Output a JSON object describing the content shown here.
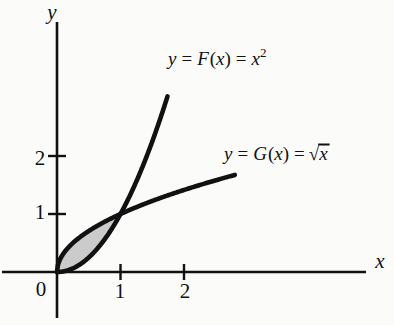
{
  "figure": {
    "name": "area-between-curves-diagram",
    "background_color": "#fbfbf9",
    "ink_color": "#111111",
    "shade_fill_color": "#c8c8c8"
  },
  "axes": {
    "x_axis_label": "x",
    "y_axis_label": "y",
    "origin_label": "0",
    "x_ticks": [
      {
        "value": 1,
        "label": "1"
      },
      {
        "value": 2,
        "label": "2"
      }
    ],
    "y_ticks": [
      {
        "value": 1,
        "label": "1"
      },
      {
        "value": 2,
        "label": "2"
      }
    ],
    "x_range": [
      -0.9,
      5.2
    ],
    "y_range": [
      -0.9,
      4.8
    ],
    "grid": false
  },
  "labels": {
    "parabola": {
      "prefix": "y",
      "eq1": "=",
      "fn": "F",
      "open": "(",
      "arg": "x",
      "close": ")",
      "eq2": "=",
      "base": "x",
      "exponent": "2"
    },
    "sqrt": {
      "prefix": "y",
      "eq1": "=",
      "fn": "G",
      "open": "(",
      "arg": "x",
      "close": ")",
      "eq2": "=",
      "radical": "√",
      "radicand": "x"
    },
    "parabola_text": "y = F(x) = x2",
    "sqrt_text": "y = G(x) = √x"
  },
  "chart_data": {
    "type": "line",
    "title": "",
    "xlabel": "x",
    "ylabel": "y",
    "xlim": [
      -0.9,
      5.2
    ],
    "ylim": [
      -0.9,
      4.8
    ],
    "grid": false,
    "legend_position": "inline-curve-labels",
    "xticks": [
      1,
      2
    ],
    "yticks": [
      1,
      2
    ],
    "series": [
      {
        "name": "y = F(x) = x^2",
        "formula": "x^2",
        "x": [
          0,
          0.1,
          0.2,
          0.3,
          0.4,
          0.5,
          0.6,
          0.7,
          0.8,
          0.9,
          1.0,
          1.1,
          1.2,
          1.3,
          1.4,
          1.5,
          1.6,
          1.7
        ],
        "y": [
          0,
          0.01,
          0.04,
          0.09,
          0.16,
          0.25,
          0.36,
          0.49,
          0.64,
          0.81,
          1.0,
          1.21,
          1.44,
          1.69,
          1.96,
          2.25,
          2.56,
          2.89
        ],
        "x_end": 1.74,
        "y_end": 3.03
      },
      {
        "name": "y = G(x) = sqrt(x)",
        "formula": "sqrt(x)",
        "x": [
          0,
          0.1,
          0.2,
          0.3,
          0.4,
          0.5,
          0.6,
          0.7,
          0.8,
          0.9,
          1.0,
          1.3,
          1.6,
          1.9,
          2.2,
          2.5,
          2.8
        ],
        "y": [
          0,
          0.316,
          0.447,
          0.548,
          0.632,
          0.707,
          0.775,
          0.837,
          0.894,
          0.949,
          1.0,
          1.14,
          1.265,
          1.378,
          1.483,
          1.581,
          1.673
        ],
        "x_end": 2.8,
        "y_end": 1.673
      }
    ],
    "shaded_region": {
      "label": "region between y = x^2 and y = sqrt(x)",
      "x_from": 0,
      "x_to": 1,
      "upper_curve": "sqrt(x)",
      "lower_curve": "x^2",
      "fill": "#c8c8c8"
    },
    "annotations": [
      {
        "text": "y = F(x) = x2",
        "x": 1.75,
        "y": 3.6
      },
      {
        "text": "y = G(x) = √x",
        "x": 2.6,
        "y": 2.15
      }
    ],
    "intersections": [
      {
        "x": 0,
        "y": 0
      },
      {
        "x": 1,
        "y": 1
      }
    ]
  }
}
